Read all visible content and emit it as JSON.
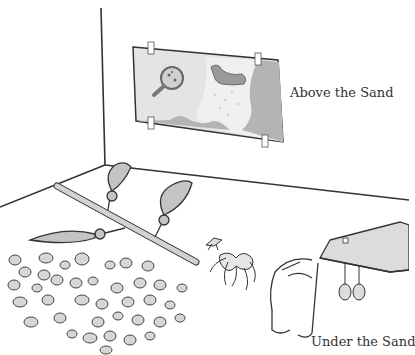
{
  "labels": {
    "above": "Above the Sand",
    "under": "Under the Sand"
  },
  "colors": {
    "line": "#333333",
    "poster_light": "#e4e4e4",
    "poster_dark": "#b4b4b4",
    "stick": "#d2d2d2",
    "pebble": "#d6d6d6",
    "table_top": "#dcdcdc"
  },
  "scene": {
    "poster": {
      "icons": [
        "magnifying-glass-icon",
        "seal-icon"
      ]
    },
    "objects": [
      "wall-corner",
      "oar-stick",
      "three-leaf-paddles",
      "pebble-pile",
      "insect",
      "seaweed-tangle",
      "sand-table",
      "hanging-pods"
    ]
  }
}
